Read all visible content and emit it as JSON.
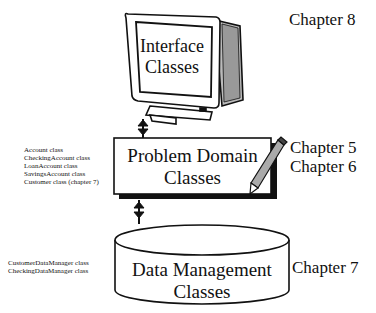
{
  "interface": {
    "title_line1": "Interface",
    "title_line2": "Classes",
    "chapter": "Chapter 8"
  },
  "problem_domain": {
    "title_line1": "Problem Domain",
    "title_line2": "Classes",
    "chapters": [
      "Chapter 5",
      "Chapter 6"
    ],
    "classes": [
      "Account class",
      "CheckingAccount class",
      "LoanAccount class",
      "SavingsAccount class",
      "Customer class (chapter 7)"
    ]
  },
  "data_management": {
    "title_line1": "Data Management",
    "title_line2": "Classes",
    "chapter": "Chapter 7",
    "classes": [
      "CustomerDataManager class",
      "CheckingDataManager class"
    ]
  }
}
